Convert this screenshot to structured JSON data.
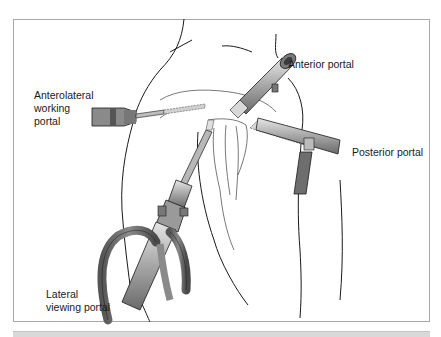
{
  "figure": {
    "labels": {
      "anterior_portal": "Anterior portal",
      "anterolateral_working_portal": "Anterolateral\nworking\nportal",
      "posterior_portal": "Posterior portal",
      "lateral_viewing_portal": "Lateral\nviewing portal"
    },
    "colors": {
      "line": "#1a1a1a",
      "instrument_dark": "#6e6e6e",
      "instrument_mid": "#9a9a9a",
      "instrument_light": "#cfcfcf",
      "frame_border": "#a8a8a8",
      "bottom_bar": "#d9d9d9"
    }
  }
}
